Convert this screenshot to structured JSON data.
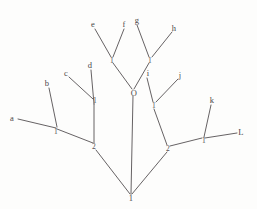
{
  "diagram": {
    "stroke_color": "#555052",
    "text_color": "#4a4648",
    "background_color": "#fdfdfc",
    "width": 257,
    "height": 209,
    "leaves": [
      {
        "id": "leaf-a",
        "label": "a",
        "x": 12,
        "y": 118
      },
      {
        "id": "leaf-b",
        "label": "b",
        "x": 47,
        "y": 83
      },
      {
        "id": "leaf-c",
        "label": "c",
        "x": 66,
        "y": 73
      },
      {
        "id": "leaf-d",
        "label": "d",
        "x": 90,
        "y": 65
      },
      {
        "id": "leaf-e",
        "label": "e",
        "x": 93,
        "y": 24
      },
      {
        "id": "leaf-f",
        "label": "f",
        "x": 124,
        "y": 24
      },
      {
        "id": "leaf-g",
        "label": "g",
        "x": 137,
        "y": 20
      },
      {
        "id": "leaf-h",
        "label": "h",
        "x": 174,
        "y": 28
      },
      {
        "id": "leaf-i",
        "label": "i",
        "x": 148,
        "y": 73
      },
      {
        "id": "leaf-j",
        "label": "j",
        "x": 180,
        "y": 75
      },
      {
        "id": "leaf-k",
        "label": "k",
        "x": 212,
        "y": 100
      },
      {
        "id": "leaf-L",
        "label": "L",
        "x": 241,
        "y": 132
      }
    ],
    "nodes": [
      {
        "id": "node-ab",
        "label": "1",
        "x": 56,
        "y": 132
      },
      {
        "id": "node-cd",
        "label": "1",
        "x": 95,
        "y": 101
      },
      {
        "id": "node-left",
        "label": "2",
        "x": 94,
        "y": 147
      },
      {
        "id": "node-ef",
        "label": "1",
        "x": 112,
        "y": 61
      },
      {
        "id": "node-gh",
        "label": "1",
        "x": 150,
        "y": 61
      },
      {
        "id": "node-O",
        "label": "O",
        "x": 134,
        "y": 93
      },
      {
        "id": "node-ij",
        "label": "1",
        "x": 154,
        "y": 106
      },
      {
        "id": "node-right",
        "label": "2",
        "x": 168,
        "y": 149
      },
      {
        "id": "node-kL",
        "label": "1",
        "x": 204,
        "y": 141
      },
      {
        "id": "node-root",
        "label": "1",
        "x": 131,
        "y": 198
      }
    ],
    "edges": [
      {
        "id": "edge-a-to-1ab",
        "from": "leaf-a",
        "to": "node-ab"
      },
      {
        "id": "edge-b-to-1ab",
        "from": "leaf-b",
        "to": "node-ab"
      },
      {
        "id": "edge-1ab-to-2left",
        "from": "node-ab",
        "to": "node-left"
      },
      {
        "id": "edge-c-to-1cd",
        "from": "leaf-c",
        "to": "node-cd"
      },
      {
        "id": "edge-d-to-1cd",
        "from": "leaf-d",
        "to": "node-cd"
      },
      {
        "id": "edge-1cd-to-2left",
        "from": "node-cd",
        "to": "node-left"
      },
      {
        "id": "edge-2left-to-root",
        "from": "node-left",
        "to": "node-root"
      },
      {
        "id": "edge-e-to-1ef",
        "from": "leaf-e",
        "to": "node-ef"
      },
      {
        "id": "edge-f-to-1ef",
        "from": "leaf-f",
        "to": "node-ef"
      },
      {
        "id": "edge-1ef-to-O",
        "from": "node-ef",
        "to": "node-O"
      },
      {
        "id": "edge-g-to-1gh",
        "from": "leaf-g",
        "to": "node-gh"
      },
      {
        "id": "edge-h-to-1gh",
        "from": "leaf-h",
        "to": "node-gh"
      },
      {
        "id": "edge-1gh-to-O",
        "from": "node-gh",
        "to": "node-O"
      },
      {
        "id": "edge-O-to-root",
        "from": "node-O",
        "to": "node-root"
      },
      {
        "id": "edge-i-to-1ij",
        "from": "leaf-i",
        "to": "node-ij"
      },
      {
        "id": "edge-j-to-1ij",
        "from": "leaf-j",
        "to": "node-ij"
      },
      {
        "id": "edge-1ij-to-2right",
        "from": "node-ij",
        "to": "node-right"
      },
      {
        "id": "edge-k-to-1kL",
        "from": "leaf-k",
        "to": "node-kL"
      },
      {
        "id": "edge-L-to-1kL",
        "from": "leaf-L",
        "to": "node-kL"
      },
      {
        "id": "edge-1kL-to-2right",
        "from": "node-kL",
        "to": "node-right"
      },
      {
        "id": "edge-2right-to-root",
        "from": "node-right",
        "to": "node-root"
      }
    ],
    "edge_endpoints": {
      "edge-a-to-1ab": {
        "x1": 18,
        "y1": 119,
        "x2": 56,
        "y2": 128
      },
      "edge-b-to-1ab": {
        "x1": 49,
        "y1": 88,
        "x2": 57,
        "y2": 127
      },
      "edge-1ab-to-2left": {
        "x1": 57,
        "y1": 129,
        "x2": 93,
        "y2": 143
      },
      "edge-c-to-1cd": {
        "x1": 69,
        "y1": 77,
        "x2": 93,
        "y2": 99
      },
      "edge-d-to-1cd": {
        "x1": 91,
        "y1": 70,
        "x2": 94,
        "y2": 104
      },
      "edge-1cd-to-2left": {
        "x1": 94,
        "y1": 104,
        "x2": 94,
        "y2": 143
      },
      "edge-2left-to-root": {
        "x1": 96,
        "y1": 150,
        "x2": 130,
        "y2": 194
      },
      "edge-e-to-1ef": {
        "x1": 95,
        "y1": 29,
        "x2": 111,
        "y2": 57
      },
      "edge-f-to-1ef": {
        "x1": 124,
        "y1": 29,
        "x2": 113,
        "y2": 57
      },
      "edge-1ef-to-O": {
        "x1": 113,
        "y1": 63,
        "x2": 132,
        "y2": 89
      },
      "edge-g-to-1gh": {
        "x1": 137,
        "y1": 25,
        "x2": 149,
        "y2": 57
      },
      "edge-h-to-1gh": {
        "x1": 172,
        "y1": 32,
        "x2": 152,
        "y2": 57
      },
      "edge-1gh-to-O": {
        "x1": 149,
        "y1": 63,
        "x2": 134,
        "y2": 89
      },
      "edge-O-to-root": {
        "x1": 133,
        "y1": 96,
        "x2": 131,
        "y2": 194
      },
      "edge-i-to-1ij": {
        "x1": 147,
        "y1": 78,
        "x2": 153,
        "y2": 102
      },
      "edge-j-to-1ij": {
        "x1": 178,
        "y1": 79,
        "x2": 156,
        "y2": 102
      },
      "edge-1ij-to-2right": {
        "x1": 154,
        "y1": 109,
        "x2": 167,
        "y2": 145
      },
      "edge-k-to-1kL": {
        "x1": 211,
        "y1": 105,
        "x2": 204,
        "y2": 137
      },
      "edge-L-to-1kL": {
        "x1": 237,
        "y1": 133,
        "x2": 205,
        "y2": 138
      },
      "edge-1kL-to-2right": {
        "x1": 202,
        "y1": 138,
        "x2": 170,
        "y2": 146
      },
      "edge-2right-to-root": {
        "x1": 167,
        "y1": 152,
        "x2": 132,
        "y2": 194
      }
    }
  }
}
